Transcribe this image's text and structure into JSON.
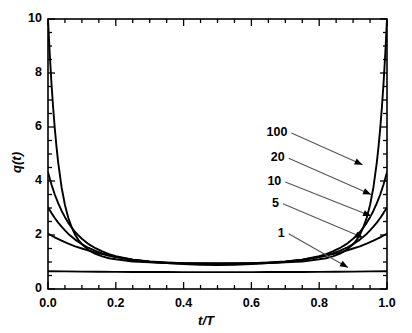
{
  "chart_data": {
    "type": "line",
    "title": "",
    "xlabel": "t/T",
    "ylabel": "q(t)",
    "xlim": [
      0.0,
      1.0
    ],
    "ylim": [
      0,
      10
    ],
    "grid": false,
    "legend_position": "inline-annotations",
    "xticks": [
      0.0,
      0.2,
      0.4,
      0.6,
      0.8,
      1.0
    ],
    "xtick_labels": [
      "0.0",
      "0.2",
      "0.4",
      "0.6",
      "0.8",
      "1.0"
    ],
    "xminor_step": 0.05,
    "yticks": [
      0,
      2,
      4,
      6,
      8,
      10
    ],
    "ytick_labels": [
      "0",
      "2",
      "4",
      "6",
      "8",
      "10"
    ],
    "yminor_step": 0.5,
    "line_color": "#000000",
    "leader_color": "#555555",
    "series": [
      {
        "name": "100",
        "label": "100",
        "label_x": 0.718,
        "label_y": 5.78,
        "arrow_x": 0.928,
        "arrow_y": 4.6,
        "endpoint_value": 10.0,
        "plateau_value": 0.97,
        "x": [
          0.0,
          0.005,
          0.01,
          0.015,
          0.02,
          0.025,
          0.03,
          0.04,
          0.05,
          0.06,
          0.07,
          0.08,
          0.09,
          0.1,
          0.12,
          0.14,
          0.16,
          0.18,
          0.2,
          0.25,
          0.3,
          0.35,
          0.4,
          0.45,
          0.5,
          0.55,
          0.6,
          0.65,
          0.7,
          0.75,
          0.8,
          0.82,
          0.84,
          0.86,
          0.88,
          0.9,
          0.91,
          0.92,
          0.93,
          0.94,
          0.95,
          0.96,
          0.97,
          0.975,
          0.98,
          0.985,
          0.99,
          0.995,
          1.0
        ],
        "y": [
          10.0,
          8.74,
          7.66,
          6.74,
          5.95,
          5.27,
          4.69,
          3.77,
          3.11,
          2.63,
          2.28,
          2.01,
          1.81,
          1.66,
          1.44,
          1.3,
          1.21,
          1.14,
          1.1,
          1.02,
          0.99,
          0.97,
          0.96,
          0.96,
          0.96,
          0.96,
          0.96,
          0.97,
          0.99,
          1.02,
          1.1,
          1.14,
          1.21,
          1.3,
          1.44,
          1.66,
          1.81,
          2.01,
          2.28,
          2.63,
          3.11,
          3.77,
          4.69,
          5.27,
          5.95,
          6.74,
          7.66,
          8.74,
          10.0
        ]
      },
      {
        "name": "20",
        "label": "20",
        "label_x": 0.71,
        "label_y": 4.84,
        "arrow_x": 0.953,
        "arrow_y": 3.5,
        "endpoint_value": 4.32,
        "plateau_value": 0.95,
        "x": [
          0.0,
          0.01,
          0.02,
          0.03,
          0.04,
          0.05,
          0.06,
          0.07,
          0.08,
          0.09,
          0.1,
          0.12,
          0.14,
          0.16,
          0.18,
          0.2,
          0.25,
          0.3,
          0.35,
          0.4,
          0.45,
          0.5,
          0.55,
          0.6,
          0.65,
          0.7,
          0.75,
          0.8,
          0.82,
          0.84,
          0.86,
          0.88,
          0.9,
          0.91,
          0.92,
          0.93,
          0.94,
          0.95,
          0.96,
          0.97,
          0.98,
          0.99,
          1.0
        ],
        "y": [
          4.32,
          3.88,
          3.5,
          3.18,
          2.9,
          2.66,
          2.45,
          2.27,
          2.11,
          1.98,
          1.86,
          1.66,
          1.51,
          1.39,
          1.29,
          1.22,
          1.09,
          1.02,
          0.98,
          0.96,
          0.95,
          0.94,
          0.95,
          0.96,
          0.98,
          1.02,
          1.09,
          1.22,
          1.29,
          1.39,
          1.51,
          1.66,
          1.86,
          1.98,
          2.11,
          2.27,
          2.45,
          2.66,
          2.9,
          3.18,
          3.5,
          3.88,
          4.32
        ]
      },
      {
        "name": "10",
        "label": "10",
        "label_x": 0.7,
        "label_y": 3.96,
        "arrow_x": 0.953,
        "arrow_y": 2.7,
        "endpoint_value": 3.02,
        "plateau_value": 0.93,
        "x": [
          0.0,
          0.01,
          0.02,
          0.03,
          0.04,
          0.05,
          0.06,
          0.08,
          0.1,
          0.12,
          0.14,
          0.16,
          0.18,
          0.2,
          0.25,
          0.3,
          0.35,
          0.4,
          0.45,
          0.5,
          0.55,
          0.6,
          0.65,
          0.7,
          0.75,
          0.8,
          0.82,
          0.84,
          0.86,
          0.88,
          0.9,
          0.92,
          0.94,
          0.95,
          0.96,
          0.97,
          0.98,
          0.99,
          1.0
        ],
        "y": [
          3.02,
          2.82,
          2.63,
          2.46,
          2.31,
          2.17,
          2.04,
          1.83,
          1.66,
          1.52,
          1.41,
          1.32,
          1.24,
          1.18,
          1.07,
          1.0,
          0.96,
          0.94,
          0.93,
          0.92,
          0.93,
          0.94,
          0.96,
          1.0,
          1.07,
          1.18,
          1.24,
          1.32,
          1.41,
          1.52,
          1.66,
          1.83,
          2.04,
          2.17,
          2.31,
          2.46,
          2.63,
          2.82,
          3.02
        ]
      },
      {
        "name": "5",
        "label": "5",
        "label_x": 0.693,
        "label_y": 3.16,
        "arrow_x": 0.93,
        "arrow_y": 1.9,
        "endpoint_value": 2.05,
        "plateau_value": 0.88,
        "x": [
          0.0,
          0.01,
          0.02,
          0.04,
          0.06,
          0.08,
          0.1,
          0.12,
          0.14,
          0.16,
          0.18,
          0.2,
          0.25,
          0.3,
          0.35,
          0.4,
          0.45,
          0.5,
          0.55,
          0.6,
          0.65,
          0.7,
          0.75,
          0.8,
          0.82,
          0.84,
          0.86,
          0.88,
          0.9,
          0.92,
          0.94,
          0.96,
          0.98,
          0.99,
          1.0
        ],
        "y": [
          2.05,
          1.98,
          1.91,
          1.79,
          1.68,
          1.58,
          1.5,
          1.42,
          1.35,
          1.29,
          1.24,
          1.19,
          1.09,
          1.01,
          0.96,
          0.92,
          0.9,
          0.89,
          0.9,
          0.92,
          0.96,
          1.01,
          1.09,
          1.19,
          1.24,
          1.29,
          1.35,
          1.42,
          1.5,
          1.58,
          1.68,
          1.79,
          1.91,
          1.98,
          2.05
        ]
      },
      {
        "name": "1",
        "label": "1",
        "label_x": 0.71,
        "label_y": 2.05,
        "arrow_x": 0.885,
        "arrow_y": 0.8,
        "endpoint_value": 0.66,
        "plateau_value": 0.63,
        "x": [
          0.0,
          0.05,
          0.1,
          0.15,
          0.2,
          0.25,
          0.3,
          0.35,
          0.4,
          0.45,
          0.5,
          0.55,
          0.6,
          0.65,
          0.7,
          0.75,
          0.8,
          0.85,
          0.9,
          0.95,
          1.0
        ],
        "y": [
          0.66,
          0.652,
          0.645,
          0.639,
          0.634,
          0.631,
          0.629,
          0.627,
          0.626,
          0.626,
          0.626,
          0.626,
          0.626,
          0.627,
          0.629,
          0.631,
          0.634,
          0.639,
          0.645,
          0.652,
          0.66
        ]
      }
    ]
  }
}
